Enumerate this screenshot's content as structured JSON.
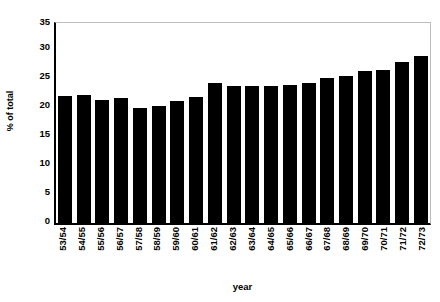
{
  "chart_data": {
    "type": "bar",
    "title": "",
    "xlabel": "year",
    "ylabel": "% of total",
    "categories": [
      "53/54",
      "54/55",
      "55/56",
      "56/57",
      "57/58",
      "58/59",
      "59/60",
      "60/61",
      "61/62",
      "62/63",
      "63/64",
      "64/65",
      "65/66",
      "66/67",
      "67/68",
      "68/69",
      "69/70",
      "70/71",
      "71/72",
      "72/73"
    ],
    "values": [
      22.1,
      22.3,
      21.5,
      21.7,
      20.1,
      20.3,
      21.2,
      22.0,
      24.3,
      23.8,
      23.9,
      23.9,
      24.1,
      24.4,
      25.3,
      25.6,
      26.4,
      26.7,
      28.1,
      29.0
    ],
    "ylim": [
      0,
      35
    ],
    "yticks": [
      0,
      5,
      10,
      15,
      20,
      25,
      30,
      35
    ],
    "ytick_labels": [
      "0",
      "5",
      "10",
      "15",
      "20",
      "25",
      "30",
      "35"
    ],
    "grid": false,
    "legend": null,
    "bar_color": "#000000",
    "axis_color": "#000000",
    "frame_color": "#bdbdbd"
  }
}
